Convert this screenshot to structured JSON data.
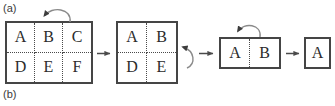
{
  "figure": {
    "panel_labels": {
      "a": "(a)",
      "b": "(b)"
    }
  },
  "stages": [
    {
      "name": "grid-3x2",
      "rows": 2,
      "cols": 3,
      "cells": [
        "A",
        "B",
        "C",
        "D",
        "E",
        "F"
      ]
    },
    {
      "name": "grid-2x2",
      "rows": 2,
      "cols": 2,
      "cells": [
        "A",
        "B",
        "D",
        "E"
      ]
    },
    {
      "name": "grid-1x2",
      "rows": 1,
      "cols": 2,
      "cells": [
        "A",
        "B"
      ]
    },
    {
      "name": "grid-1x1",
      "rows": 1,
      "cols": 1,
      "cells": [
        "A"
      ]
    }
  ],
  "connectors": [
    {
      "name": "arrow-stage1-to-stage2",
      "type": "straight-right-arrow"
    },
    {
      "name": "arrow-stage2-to-stage3",
      "type": "straight-right-arrow"
    },
    {
      "name": "arrow-stage3-to-stage4",
      "type": "straight-right-arrow"
    }
  ],
  "operations": [
    {
      "name": "curved-arrow-remove-column-stage1",
      "type": "curved-arrow",
      "points_to": "vertical-divider"
    },
    {
      "name": "curved-arrow-remove-row-stage2",
      "type": "curved-arrow",
      "points_to": "horizontal-divider"
    },
    {
      "name": "curved-arrow-remove-column-stage3",
      "type": "curved-arrow",
      "points_to": "vertical-divider"
    }
  ],
  "colors": {
    "border": "#454545",
    "divider": "#4a4a4a",
    "text": "#2b2b2b",
    "label": "#3a3a3a",
    "arrow": "#5a5a5a"
  }
}
